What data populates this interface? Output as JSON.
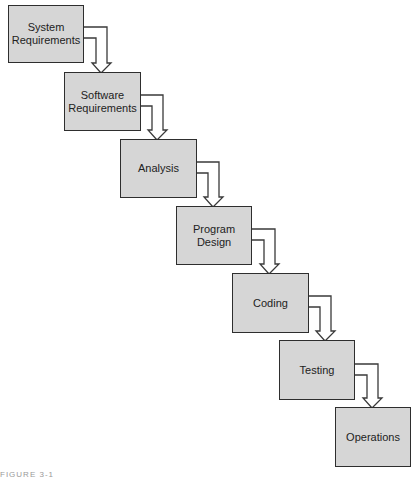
{
  "diagram": {
    "type": "waterfall",
    "stages": [
      {
        "label": "System\nRequirements"
      },
      {
        "label": "Software\nRequirements"
      },
      {
        "label": "Analysis"
      },
      {
        "label": "Program\nDesign"
      },
      {
        "label": "Coding"
      },
      {
        "label": "Testing"
      },
      {
        "label": "Operations"
      }
    ],
    "caption": "FIGURE 3-1"
  },
  "colors": {
    "box_fill": "#d6d6d6",
    "box_border": "#2e2e2e",
    "text": "#222222"
  }
}
